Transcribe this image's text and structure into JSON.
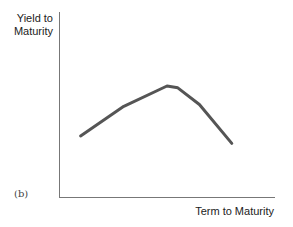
{
  "chart_data": {
    "type": "line",
    "title": "",
    "panel_label": "(b)",
    "xlabel": "Term to Maturity",
    "ylabel": "Yield to Maturity",
    "ylabel_lines": [
      "Yield to",
      "Maturity"
    ],
    "grid": false,
    "legend": null,
    "series": [
      {
        "name": "Yield curve",
        "color": "#555555",
        "x": [
          0.1,
          0.3,
          0.5,
          0.55,
          0.65,
          0.8
        ],
        "y": [
          0.33,
          0.49,
          0.6,
          0.59,
          0.5,
          0.29
        ]
      }
    ],
    "xlim": [
      0,
      1
    ],
    "ylim": [
      0,
      1
    ]
  }
}
